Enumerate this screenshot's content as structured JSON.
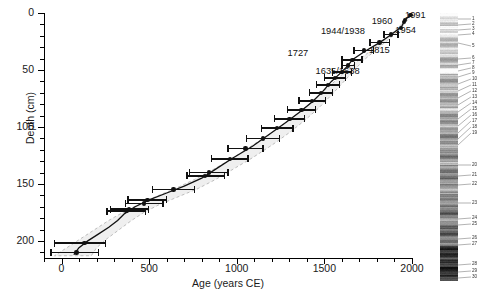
{
  "figure": {
    "kind": "age-depth-model",
    "core_image_label": "sediment-core-photograph"
  },
  "chart_data": {
    "type": "scatter",
    "title": "",
    "xlabel": "Age (years CE)",
    "ylabel": "Depth (cm)",
    "xlim": [
      -100,
      2000
    ],
    "ylim": [
      0,
      215
    ],
    "y_inverted": true,
    "grid": false,
    "legend": "none",
    "xticks": [
      0,
      500,
      1000,
      1500,
      2000
    ],
    "xtick_labels": [
      "0",
      "500",
      "1000",
      "1500",
      "2000"
    ],
    "xticks_minor": [
      -100,
      100,
      200,
      300,
      400,
      600,
      700,
      800,
      900,
      1100,
      1200,
      1300,
      1400,
      1600,
      1700,
      1800,
      1900
    ],
    "yticks": [
      0,
      50,
      100,
      150,
      200
    ],
    "ytick_labels": [
      "0",
      "50",
      "100",
      "150",
      "200"
    ],
    "yticks_minor": [
      10,
      20,
      30,
      40,
      60,
      70,
      80,
      90,
      110,
      120,
      130,
      140,
      160,
      170,
      180,
      190,
      210
    ],
    "series": [
      {
        "name": "dated horizons",
        "points": [
          {
            "age": 1991,
            "depth": 2,
            "err_low": 1991,
            "err_high": 1991
          },
          {
            "age": 1954,
            "depth": 8,
            "err_low": 1954,
            "err_high": 1954
          },
          {
            "age": 1960,
            "depth": 6,
            "err_low": 1960,
            "err_high": 1960
          },
          {
            "age": 1938,
            "depth": 13,
            "err_low": 1938,
            "err_high": 1944
          },
          {
            "age": 1880,
            "depth": 19,
            "err_low": 1840,
            "err_high": 1920
          },
          {
            "age": 1815,
            "depth": 26,
            "err_low": 1760,
            "err_high": 1870
          },
          {
            "age": 1727,
            "depth": 33,
            "err_low": 1670,
            "err_high": 1780
          },
          {
            "age": 1660,
            "depth": 41,
            "err_low": 1600,
            "err_high": 1715
          },
          {
            "age": 1636,
            "depth": 46,
            "err_low": 1600,
            "err_high": 1672
          },
          {
            "age": 1600,
            "depth": 52,
            "err_low": 1545,
            "err_high": 1655
          },
          {
            "age": 1560,
            "depth": 57,
            "err_low": 1500,
            "err_high": 1620
          },
          {
            "age": 1520,
            "depth": 63,
            "err_low": 1455,
            "err_high": 1585
          },
          {
            "age": 1480,
            "depth": 70,
            "err_low": 1415,
            "err_high": 1545
          },
          {
            "age": 1430,
            "depth": 77,
            "err_low": 1355,
            "err_high": 1505
          },
          {
            "age": 1370,
            "depth": 85,
            "err_low": 1290,
            "err_high": 1450
          },
          {
            "age": 1300,
            "depth": 93,
            "err_low": 1215,
            "err_high": 1385
          },
          {
            "age": 1230,
            "depth": 101,
            "err_low": 1140,
            "err_high": 1320
          },
          {
            "age": 1150,
            "depth": 110,
            "err_low": 1055,
            "err_high": 1245
          },
          {
            "age": 1050,
            "depth": 119,
            "err_low": 950,
            "err_high": 1150
          },
          {
            "age": 960,
            "depth": 128,
            "err_low": 855,
            "err_high": 1065
          },
          {
            "age": 840,
            "depth": 140,
            "err_low": 730,
            "err_high": 950
          },
          {
            "age": 820,
            "depth": 143,
            "err_low": 715,
            "err_high": 930
          },
          {
            "age": 640,
            "depth": 155,
            "err_low": 520,
            "err_high": 760
          },
          {
            "age": 490,
            "depth": 164,
            "err_low": 380,
            "err_high": 600
          },
          {
            "age": 470,
            "depth": 167,
            "err_low": 365,
            "err_high": 580
          },
          {
            "age": 370,
            "depth": 174,
            "err_low": 260,
            "err_high": 480
          },
          {
            "age": 385,
            "depth": 172,
            "err_low": 280,
            "err_high": 495
          },
          {
            "age": 130,
            "depth": 202,
            "err_low": -40,
            "err_high": 250
          },
          {
            "age": 85,
            "depth": 210,
            "err_low": -60,
            "err_high": 210
          }
        ]
      }
    ],
    "model_curve": [
      {
        "age": 1991,
        "depth": 2
      },
      {
        "age": 1960,
        "depth": 6
      },
      {
        "age": 1940,
        "depth": 12
      },
      {
        "age": 1880,
        "depth": 19
      },
      {
        "age": 1815,
        "depth": 26
      },
      {
        "age": 1727,
        "depth": 34
      },
      {
        "age": 1660,
        "depth": 41
      },
      {
        "age": 1636,
        "depth": 46
      },
      {
        "age": 1590,
        "depth": 53
      },
      {
        "age": 1540,
        "depth": 60
      },
      {
        "age": 1490,
        "depth": 69
      },
      {
        "age": 1430,
        "depth": 78
      },
      {
        "age": 1360,
        "depth": 87
      },
      {
        "age": 1280,
        "depth": 96
      },
      {
        "age": 1190,
        "depth": 106
      },
      {
        "age": 1090,
        "depth": 117
      },
      {
        "age": 980,
        "depth": 127
      },
      {
        "age": 880,
        "depth": 137
      },
      {
        "age": 800,
        "depth": 145
      },
      {
        "age": 700,
        "depth": 152
      },
      {
        "age": 600,
        "depth": 158
      },
      {
        "age": 500,
        "depth": 164
      },
      {
        "age": 420,
        "depth": 170
      },
      {
        "age": 360,
        "depth": 176
      },
      {
        "age": 320,
        "depth": 182
      },
      {
        "age": 270,
        "depth": 188
      },
      {
        "age": 210,
        "depth": 194
      },
      {
        "age": 150,
        "depth": 200
      },
      {
        "age": 100,
        "depth": 206
      },
      {
        "age": 70,
        "depth": 212
      }
    ],
    "confidence_band": {
      "style": "dashed-grey-envelope",
      "upper": [
        {
          "age": 1995,
          "depth": 2
        },
        {
          "age": 1965,
          "depth": 8
        },
        {
          "age": 1920,
          "depth": 16
        },
        {
          "age": 1860,
          "depth": 24
        },
        {
          "age": 1790,
          "depth": 33
        },
        {
          "age": 1720,
          "depth": 42
        },
        {
          "age": 1660,
          "depth": 52
        },
        {
          "age": 1600,
          "depth": 62
        },
        {
          "age": 1540,
          "depth": 72
        },
        {
          "age": 1470,
          "depth": 83
        },
        {
          "age": 1390,
          "depth": 94
        },
        {
          "age": 1300,
          "depth": 105
        },
        {
          "age": 1200,
          "depth": 116
        },
        {
          "age": 1090,
          "depth": 127
        },
        {
          "age": 980,
          "depth": 137
        },
        {
          "age": 880,
          "depth": 146
        },
        {
          "age": 780,
          "depth": 154
        },
        {
          "age": 670,
          "depth": 161
        },
        {
          "age": 560,
          "depth": 168
        },
        {
          "age": 470,
          "depth": 175
        },
        {
          "age": 400,
          "depth": 182
        },
        {
          "age": 330,
          "depth": 190
        },
        {
          "age": 260,
          "depth": 198
        },
        {
          "age": 200,
          "depth": 206
        },
        {
          "age": 170,
          "depth": 213
        }
      ],
      "lower": [
        {
          "age": 1988,
          "depth": 2
        },
        {
          "age": 1952,
          "depth": 8
        },
        {
          "age": 1900,
          "depth": 16
        },
        {
          "age": 1840,
          "depth": 24
        },
        {
          "age": 1765,
          "depth": 33
        },
        {
          "age": 1690,
          "depth": 42
        },
        {
          "age": 1615,
          "depth": 52
        },
        {
          "age": 1545,
          "depth": 62
        },
        {
          "age": 1470,
          "depth": 72
        },
        {
          "age": 1390,
          "depth": 83
        },
        {
          "age": 1300,
          "depth": 94
        },
        {
          "age": 1200,
          "depth": 105
        },
        {
          "age": 1090,
          "depth": 116
        },
        {
          "age": 980,
          "depth": 127
        },
        {
          "age": 870,
          "depth": 137
        },
        {
          "age": 760,
          "depth": 146
        },
        {
          "age": 650,
          "depth": 154
        },
        {
          "age": 540,
          "depth": 161
        },
        {
          "age": 440,
          "depth": 168
        },
        {
          "age": 350,
          "depth": 175
        },
        {
          "age": 270,
          "depth": 182
        },
        {
          "age": 190,
          "depth": 190
        },
        {
          "age": 110,
          "depth": 198
        },
        {
          "age": 30,
          "depth": 206
        },
        {
          "age": -40,
          "depth": 213
        }
      ]
    },
    "annotations": [
      {
        "label": "1991",
        "age": 1991,
        "depth": 2,
        "text_age": 1960,
        "text_depth": 3,
        "align": "left"
      },
      {
        "label": "1960",
        "age": 1960,
        "depth": 6,
        "text_age": 1770,
        "text_depth": 8,
        "align": "left"
      },
      {
        "label": "1954",
        "age": 1954,
        "depth": 9,
        "text_age": 1905,
        "text_depth": 16,
        "align": "left"
      },
      {
        "label": "1944/1938",
        "age": 1940,
        "depth": 13,
        "text_age": 1480,
        "text_depth": 17,
        "align": "left"
      },
      {
        "label": "1815",
        "age": 1815,
        "depth": 26,
        "text_age": 1755,
        "text_depth": 33,
        "align": "left"
      },
      {
        "label": "1727",
        "age": 1727,
        "depth": 34,
        "text_age": 1290,
        "text_depth": 36,
        "align": "left"
      },
      {
        "label": "1635/1638",
        "age": 1636,
        "depth": 46,
        "text_age": 1450,
        "text_depth": 52,
        "align": "left"
      }
    ]
  },
  "core_strip": {
    "name": "sediment-core-photograph",
    "layer_numbers": [
      "1",
      "2",
      "3",
      "4",
      "5",
      "6",
      "7",
      "8",
      "9",
      "10",
      "11",
      "12",
      "13",
      "14",
      "15",
      "16",
      "17",
      "18",
      "19",
      "20",
      "21",
      "22",
      "23",
      "24",
      "25",
      "26",
      "27",
      "28",
      "29",
      "30"
    ]
  },
  "colors": {
    "axis": "#000000",
    "data": "#111111",
    "envelope_fill": "#efefef",
    "envelope_edge": "#bdbdbd",
    "text": "#1a1a1a"
  }
}
